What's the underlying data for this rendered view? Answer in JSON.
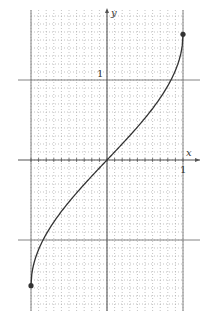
{
  "chart_data": {
    "type": "line",
    "title": "",
    "function": "y = arcsin(x)",
    "xlabel": "x",
    "ylabel": "y",
    "xlim": [
      -1.0,
      1.0
    ],
    "ylim": [
      -1.9,
      1.9
    ],
    "x_tick_label": "1",
    "y_tick_label": "1",
    "major_gridlines": {
      "x": [
        -1,
        1
      ],
      "y": [
        -1,
        1
      ]
    },
    "minor_grid": {
      "step": 0.1,
      "style": "dotted"
    },
    "grid": true,
    "series": [
      {
        "name": "arcsin(x)",
        "x": [
          -1.0,
          -0.9,
          -0.8,
          -0.7,
          -0.6,
          -0.5,
          -0.4,
          -0.3,
          -0.2,
          -0.1,
          0.0,
          0.1,
          0.2,
          0.3,
          0.4,
          0.5,
          0.6,
          0.7,
          0.8,
          0.9,
          1.0
        ],
        "y": [
          -1.571,
          -1.12,
          -0.927,
          -0.775,
          -0.644,
          -0.524,
          -0.412,
          -0.305,
          -0.201,
          -0.1,
          0.0,
          0.1,
          0.201,
          0.305,
          0.412,
          0.524,
          0.644,
          0.775,
          0.927,
          1.12,
          1.571
        ]
      }
    ],
    "endpoints": [
      {
        "x": -1.0,
        "y": -1.571,
        "style": "closed"
      },
      {
        "x": 1.0,
        "y": 1.571,
        "style": "closed"
      }
    ],
    "colors": {
      "curve": "#333333",
      "axis": "#555555",
      "grid": "#9a9a9a",
      "major": "#777777"
    }
  }
}
